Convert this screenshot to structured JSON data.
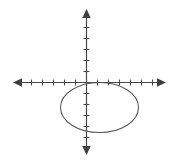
{
  "figure": {
    "background_color": "#ffffff",
    "width": 173,
    "height": 164
  },
  "chart_data": {
    "type": "scatter",
    "title": "",
    "xlabel": "",
    "ylabel": "",
    "grid": false,
    "legend": null,
    "axes": {
      "origin_px": {
        "x": 86.5,
        "y": 82.5
      },
      "tick_spacing_px": 11,
      "axis_color": "#4a4a4a",
      "axis_stroke_width": 1.2,
      "x_axis": {
        "start_px": 13,
        "end_px": 166,
        "ticks_left_of_origin": 6,
        "ticks_right_of_origin": 6,
        "xlim": [
          -7,
          7
        ],
        "tick_labels": []
      },
      "y_axis": {
        "start_px": 9,
        "end_px": 155,
        "ticks_above_origin": 6,
        "ticks_below_origin": 6,
        "ylim": [
          -6,
          6
        ],
        "tick_labels": []
      },
      "arrowheads": [
        "left",
        "right",
        "up",
        "down"
      ],
      "tick_length_px": 5
    },
    "shapes": [
      {
        "kind": "ellipse",
        "name": "ellipse-curve",
        "center_px": {
          "x": 99.5,
          "y": 107.5
        },
        "radius_x_px": 39,
        "radius_y_px": 25,
        "center_units": {
          "x": 1.2,
          "y": -2.3
        },
        "semi_axis_x_units": 3.5,
        "semi_axis_y_units": 2.3,
        "stroke_color": "#595959",
        "stroke_width": 1.1,
        "fill": "none"
      }
    ]
  }
}
